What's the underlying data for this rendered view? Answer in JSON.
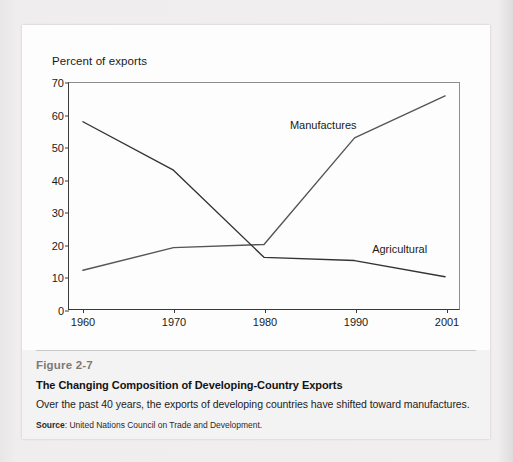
{
  "figure": {
    "number": "Figure 2-7",
    "heading": "The Changing Composition of Developing-Country Exports",
    "description": "Over the past 40 years, the exports of developing countries have shifted toward manufactures.",
    "source_label": "Source",
    "source_text": ": United Nations Council on Trade and Development."
  },
  "chart_data": {
    "type": "line",
    "title": "",
    "axis_note": "Percent of exports",
    "xlabel": "",
    "ylabel": "Percent of exports",
    "categories": [
      "1960",
      "1970",
      "1980",
      "1990",
      "2001"
    ],
    "ylim": [
      0,
      70
    ],
    "yticks": [
      0,
      10,
      20,
      30,
      40,
      50,
      60,
      70
    ],
    "ytick_labels": [
      "0",
      "10",
      "20",
      "30",
      "40",
      "50",
      "60",
      "70"
    ],
    "grid": false,
    "legend_position": "inline-labels",
    "series": [
      {
        "name": "Manufactures",
        "values": [
          12,
          19,
          20,
          53,
          66
        ],
        "color": "#555555",
        "label_x_category_fraction": 0.66,
        "label_value": 57
      },
      {
        "name": "Agricultural",
        "values": [
          58,
          43,
          16,
          15,
          10
        ],
        "color": "#333333",
        "label_x_category_fraction": 0.87,
        "label_value": 19
      }
    ]
  },
  "colors": {
    "page_background": "#eceaea",
    "card_background": "#fdfdfd",
    "caption_background": "#f4f3f3",
    "axis": "#3a3a3a",
    "frame": "#8d8d8d",
    "figure_number": "#7b7979"
  }
}
